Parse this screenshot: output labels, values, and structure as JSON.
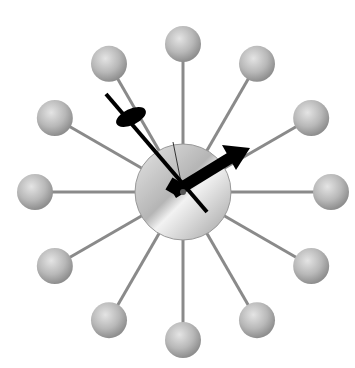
{
  "image": {
    "caption": "Ball wall clock with twelve spokes ending in round wooden balls, brushed aluminum center disc and black hour/minute hands",
    "subject": "ball-clock",
    "center": [
      183,
      192
    ],
    "spoke_count": 12,
    "ball_radius": 18,
    "spoke_length": 148,
    "colors": {
      "background": "#ffffff",
      "ball": "#b8b8b8",
      "spoke": "#8a8a8a",
      "disc": "#c9c9c9",
      "hands": "#000000"
    }
  }
}
